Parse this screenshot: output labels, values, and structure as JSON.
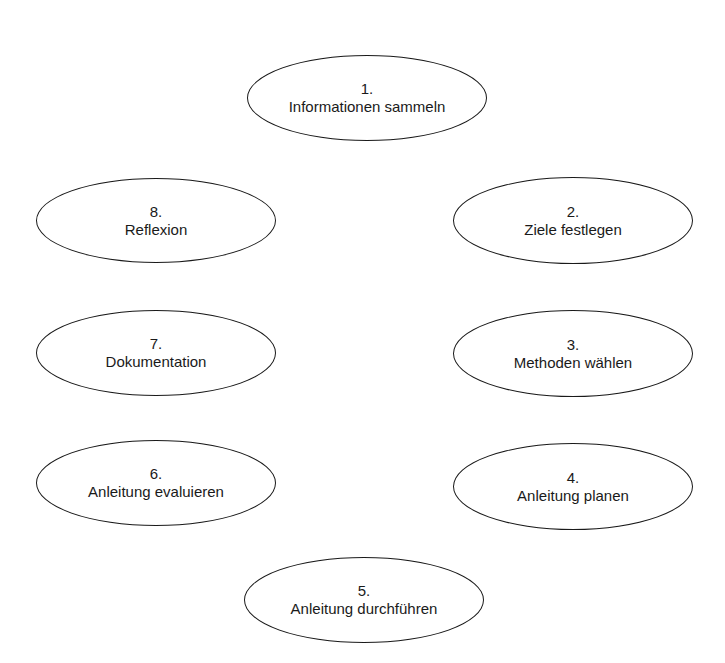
{
  "diagram": {
    "type": "cycle",
    "nodes": [
      {
        "number": "1.",
        "label": "Informationen sammeln",
        "box": {
          "x": 247,
          "y": 55,
          "w": 240,
          "h": 86
        }
      },
      {
        "number": "2.",
        "label": "Ziele festlegen",
        "box": {
          "x": 453,
          "y": 177,
          "w": 240,
          "h": 87
        }
      },
      {
        "number": "3.",
        "label": "Methoden wählen",
        "box": {
          "x": 453,
          "y": 310,
          "w": 240,
          "h": 87
        }
      },
      {
        "number": "4.",
        "label": "Anleitung planen",
        "box": {
          "x": 453,
          "y": 443,
          "w": 240,
          "h": 87
        }
      },
      {
        "number": "5.",
        "label": "Anleitung durchführen",
        "box": {
          "x": 244,
          "y": 557,
          "w": 240,
          "h": 86
        }
      },
      {
        "number": "6.",
        "label": "Anleitung evaluieren",
        "box": {
          "x": 36,
          "y": 440,
          "w": 240,
          "h": 86
        }
      },
      {
        "number": "7.",
        "label": "Dokumentation",
        "box": {
          "x": 36,
          "y": 310,
          "w": 240,
          "h": 86
        }
      },
      {
        "number": "8.",
        "label": "Reflexion",
        "box": {
          "x": 36,
          "y": 178,
          "w": 240,
          "h": 85
        }
      }
    ]
  },
  "colors": {
    "background": "#ffffff",
    "stroke": "#1a1a1a",
    "text": "#1a1a1a"
  }
}
